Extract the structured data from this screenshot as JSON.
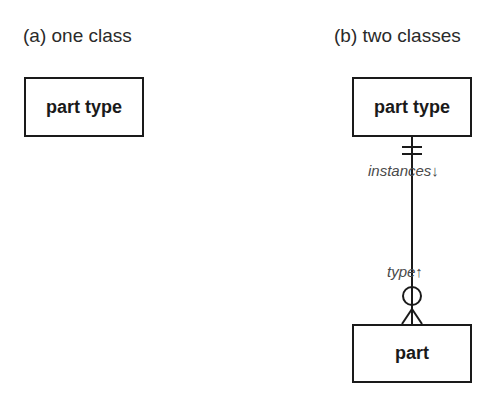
{
  "panels": {
    "a": {
      "caption": "(a) one class",
      "classes": [
        {
          "name": "part type"
        }
      ]
    },
    "b": {
      "caption": "(b) two classes",
      "classes": [
        {
          "name": "part type"
        },
        {
          "name": "part"
        }
      ],
      "relationship": {
        "from": "part type",
        "to": "part",
        "role_top": "instances↓",
        "role_bottom": "type↑",
        "top_end": "exactly-one",
        "bottom_end": "zero-or-many"
      }
    }
  },
  "colors": {
    "line": "#1a1a1a",
    "caption": "#2a2a2a",
    "role_text": "#4a4a4a"
  }
}
